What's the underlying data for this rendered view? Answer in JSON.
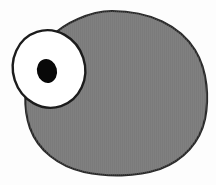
{
  "canvas": {
    "width": 216,
    "height": 185,
    "background_color": "#fdfdfd"
  },
  "artwork": {
    "title": "Cartoon blob creature with one large eye",
    "subject": "single-eyed rounded gray character",
    "style": "flat cartoon illustration with dark outline and halftone texture"
  },
  "palette": {
    "background": "#fdfdfd",
    "body_fill": "#808080",
    "body_outline": "#2a2a2a",
    "eye_white": "#ffffff",
    "eye_outline": "#1c1c1c",
    "pupil_fill": "#080808",
    "texture_line": "#6f6f6f"
  },
  "shapes": {
    "body": {
      "name": "body-blob",
      "fill": "#808080",
      "stroke": "#2a2a2a",
      "stroke_width": 2.2,
      "bounds": {
        "x": 24,
        "y": 11,
        "width": 184,
        "height": 164
      },
      "path": "M 112 11 C 150 11 180 26 195 50 C 208 71 209 99 205 119 C 200 142 184 160 160 169 C 136 177 107 177 84 172 C 58 166 38 150 30 128 C 23 108 24 84 32 65 C 41 44 57 28 78 19 C 89 14 100 11 112 11 Z"
    },
    "eye": {
      "name": "eye-ball",
      "fill": "#ffffff",
      "stroke": "#1c1c1c",
      "stroke_width": 2.4,
      "center": {
        "cx": 49,
        "cy": 69
      },
      "radii": {
        "rx": 36,
        "ry": 39
      },
      "rotation_deg": -18
    },
    "pupil": {
      "name": "pupil",
      "fill": "#080808",
      "center": {
        "cx": 47,
        "cy": 71
      },
      "radii": {
        "rx": 10,
        "ry": 12
      },
      "rotation_deg": -14
    }
  },
  "texture": {
    "enabled": true,
    "kind": "vertical-hatch",
    "spacing_px": 2,
    "color": "#737373",
    "opacity": 0.35
  }
}
